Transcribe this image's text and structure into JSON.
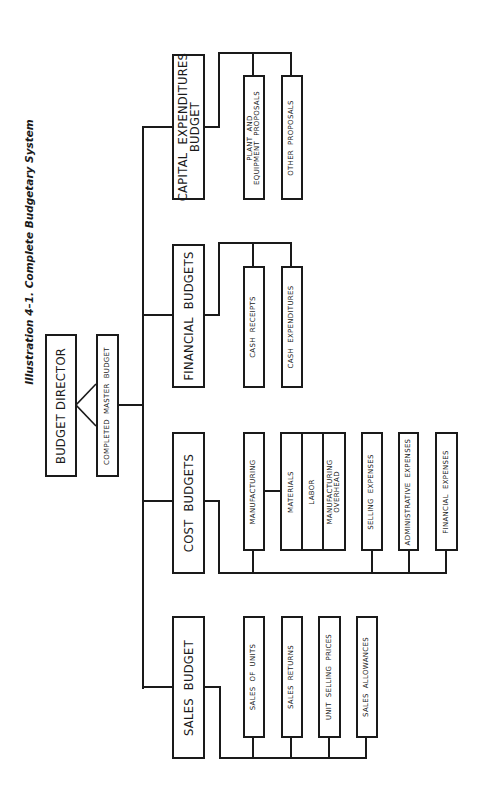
{
  "title": "Illustration 4–1. Complete Budgetary System",
  "root": {
    "label": "BUDGET DIRECTOR",
    "output": "COMPLETED  MASTER  BUDGET"
  },
  "budgets": [
    {
      "label": "SALES  BUDGET",
      "items": [
        "SALES  OF  UNITS",
        "SALES  RETURNS",
        "UNIT  SELLING  PRICES",
        "SALES  ALLOWANCES"
      ]
    },
    {
      "label": "COST  BUDGETS",
      "items": [
        "MANUFACTURING",
        "SELLING  EXPENSES",
        "ADMINISTRATIVE  EXPENSES",
        "FINANCIAL  EXPENSES"
      ],
      "manufacturing_components": [
        "MATERIALS",
        "LABOR",
        "MANUFACTURING\nOVERHEAD"
      ]
    },
    {
      "label": "FINANCIAL  BUDGETS",
      "items": [
        "CASH  RECEIPTS",
        "CASH  EXPENDITURES"
      ]
    },
    {
      "label": "CAPITAL  EXPENDITURES\nBUDGET",
      "items": [
        "PLANT  AND\nEQUIPMENT  PROPOSALS",
        "OTHER  PROPOSALS"
      ]
    }
  ]
}
